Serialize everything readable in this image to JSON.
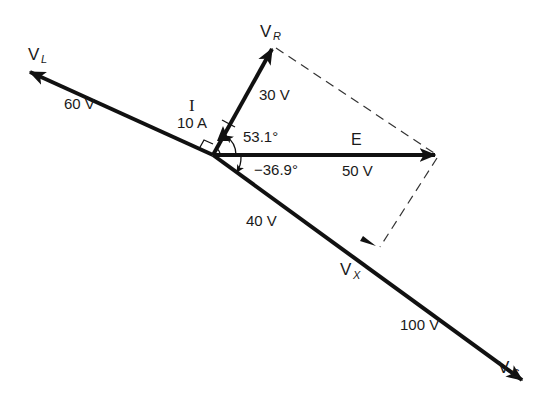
{
  "diagram": {
    "type": "phasor-diagram",
    "origin": [
      213,
      155
    ],
    "phasors": [
      {
        "id": "VL",
        "symbol": "V",
        "subscript": "L",
        "magnitude_label": "60 V",
        "tip": [
          28,
          71
        ]
      },
      {
        "id": "VR",
        "symbol": "V",
        "subscript": "R",
        "magnitude_label": "30 V",
        "tip": [
          273,
          47
        ]
      },
      {
        "id": "E",
        "symbol": "E",
        "subscript": "",
        "magnitude_label": "50 V",
        "tip": [
          437,
          155
        ]
      },
      {
        "id": "VX",
        "symbol": "V",
        "subscript": "X",
        "magnitude_label": "40 V",
        "tip": [
          377,
          247
        ]
      },
      {
        "id": "VC",
        "symbol": "V",
        "subscript": "C",
        "magnitude_label": "100 V",
        "tip": [
          523,
          380
        ]
      },
      {
        "id": "I",
        "symbol": "I",
        "subscript": "",
        "magnitude_label": "10 A"
      }
    ],
    "angles": [
      {
        "label": "53.1°",
        "between": [
          "E",
          "VR"
        ]
      },
      {
        "label": "−36.9°",
        "between": [
          "E",
          "VX"
        ]
      }
    ],
    "construction_lines": [
      {
        "from": "VR",
        "to": "E",
        "style": "dashed"
      },
      {
        "from": "E",
        "to": "VX",
        "style": "dashed"
      }
    ]
  },
  "labels": {
    "vl_symbol": "V",
    "vl_sub": "L",
    "vl_mag": "60 V",
    "vr_symbol": "V",
    "vr_sub": "R",
    "vr_mag": "30 V",
    "i_symbol": "I",
    "i_mag": "10 A",
    "e_symbol": "E",
    "e_mag": "50 V",
    "angle_vr": "53.1°",
    "angle_vx": "−36.9°",
    "vx_symbol": "V",
    "vx_sub": "X",
    "vx_mag": "40 V",
    "vc_symbol": "V",
    "vc_sub": "C",
    "vc_mag": "100 V"
  }
}
